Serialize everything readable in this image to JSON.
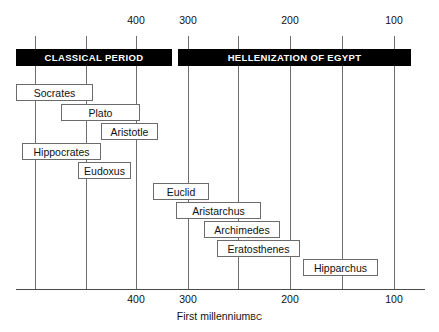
{
  "chart_data": {
    "type": "table",
    "title": "",
    "caption": "First millennium",
    "caption_suffix": "BC",
    "xlabel": "First millennium BC",
    "ylabel": "",
    "xlim": [
      435,
      85
    ],
    "axis_direction": "descending-bc",
    "grid": true,
    "legend": false,
    "top_tick_labels": [
      "400",
      "300",
      "200",
      "100"
    ],
    "bottom_tick_labels": [
      "400",
      "300",
      "200",
      "100"
    ],
    "gridline_years": [
      435,
      400,
      365,
      330,
      295,
      260,
      225,
      190,
      155,
      120,
      85
    ],
    "labeled_years": [
      400,
      300,
      200,
      100
    ],
    "eras": [
      {
        "label": "CLASSICAL PERIOD",
        "start": 430,
        "end": 320
      },
      {
        "label": "HELLENIZATION OF EGYPT",
        "start": 318,
        "end": 90
      }
    ],
    "people": [
      {
        "name": "Socrates",
        "start": 430,
        "end": 355
      },
      {
        "name": "Plato",
        "start": 386,
        "end": 308
      },
      {
        "name": "Aristotle",
        "start": 347,
        "end": 291
      },
      {
        "name": "Hippocrates",
        "start": 424,
        "end": 347
      },
      {
        "name": "Eudoxus",
        "start": 369,
        "end": 317
      },
      {
        "name": "Euclid",
        "start": 295,
        "end": 240
      },
      {
        "name": "Aristarchus",
        "start": 272,
        "end": 189
      },
      {
        "name": "Archimedes",
        "start": 245,
        "end": 171
      },
      {
        "name": "Eratosthenes",
        "start": 232,
        "end": 151
      },
      {
        "name": "Hipparchus",
        "start": 148,
        "end": 75
      }
    ]
  },
  "geometry": {
    "grid_top": 36,
    "grid_bottom": 289,
    "gridline_x": [
      35,
      86,
      136,
      188,
      238,
      290,
      342,
      394
    ],
    "axis_left": 16,
    "axis_right": 425,
    "top_label_y": 14,
    "bottom_label_y": 293,
    "top_label_x": [
      136,
      188,
      290,
      394
    ],
    "bottom_label_x": [
      136,
      188,
      290,
      394
    ],
    "era_bars": [
      {
        "x": 16,
        "y": 49,
        "w": 156,
        "h": 17
      },
      {
        "x": 178,
        "y": 49,
        "w": 233,
        "h": 17
      }
    ],
    "boxes": [
      {
        "x": 16,
        "y": 84,
        "w": 77,
        "h": 17
      },
      {
        "x": 61,
        "y": 104,
        "w": 79,
        "h": 17
      },
      {
        "x": 101,
        "y": 123,
        "w": 57,
        "h": 17
      },
      {
        "x": 22,
        "y": 143,
        "w": 79,
        "h": 17
      },
      {
        "x": 78,
        "y": 162,
        "w": 53,
        "h": 17
      },
      {
        "x": 153,
        "y": 183,
        "w": 56,
        "h": 17
      },
      {
        "x": 176,
        "y": 202,
        "w": 85,
        "h": 17
      },
      {
        "x": 204,
        "y": 221,
        "w": 76,
        "h": 17
      },
      {
        "x": 217,
        "y": 240,
        "w": 83,
        "h": 17
      },
      {
        "x": 303,
        "y": 259,
        "w": 75,
        "h": 17
      }
    ],
    "caption_y": 310
  },
  "colors": {
    "background": "#ffffff",
    "era_bar": "#000000",
    "era_text": "#ffffff",
    "gridline": "#6e6e6e",
    "box_border": "#6b6b6b",
    "text": "#111111"
  }
}
